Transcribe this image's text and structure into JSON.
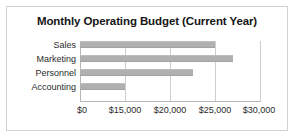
{
  "chart_data": {
    "type": "bar",
    "orientation": "horizontal",
    "title": "Monthly Operating Budget (Current Year)",
    "xlabel": "",
    "ylabel": "",
    "categories": [
      "Sales",
      "Marketing",
      "Personnel",
      "Accounting"
    ],
    "values": [
      25000,
      27000,
      22500,
      15000
    ],
    "series": [
      {
        "name": "Monthly Operating Budget",
        "values": [
          25000,
          27000,
          22500,
          15000
        ]
      }
    ],
    "tick_labels": [
      "$0",
      "$15,000",
      "$20,000",
      "$25,000",
      "$30,000"
    ],
    "tick_values": [
      0,
      15000,
      20000,
      25000,
      30000
    ],
    "xlim": [
      0,
      30000
    ],
    "axis_note": "Axis break: the 0 to 15,000 interval occupies the same width as each 5,000 step",
    "grid": true,
    "legend": false,
    "colors": {
      "bar_fill": "#b0b0b0",
      "gridline": "#cfcfcf",
      "axis_line": "#b8b8b8",
      "title_text": "#161616",
      "label_text": "#2a2a2a",
      "frame_border": "#d2d2d2",
      "background": "#ffffff"
    }
  }
}
